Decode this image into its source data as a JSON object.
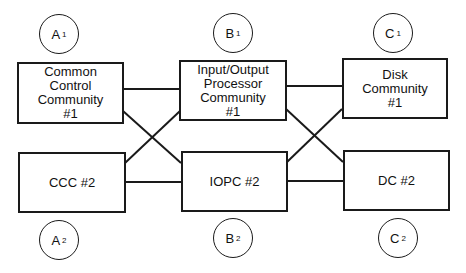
{
  "diagram": {
    "nodes": {
      "a1": {
        "lines": [
          "Common",
          "Control",
          "Community",
          "#1"
        ]
      },
      "a2": {
        "lines": [
          "CCC #2"
        ]
      },
      "b1": {
        "lines": [
          "Input/Output",
          "Processor",
          "Community",
          "#1"
        ]
      },
      "b2": {
        "lines": [
          "IOPC #2"
        ]
      },
      "c1": {
        "lines": [
          "Disk",
          "Community",
          "#1"
        ]
      },
      "c2": {
        "lines": [
          "DC #2"
        ]
      }
    },
    "labels": {
      "a1": {
        "letter": "A",
        "sub": "1"
      },
      "a2": {
        "letter": "A",
        "sub": "2"
      },
      "b1": {
        "letter": "B",
        "sub": "1"
      },
      "b2": {
        "letter": "B",
        "sub": "2"
      },
      "c1": {
        "letter": "C",
        "sub": "1"
      },
      "c2": {
        "letter": "C",
        "sub": "2"
      }
    },
    "connections": [
      {
        "from": "a1",
        "to": "b1"
      },
      {
        "from": "a1",
        "to": "b2"
      },
      {
        "from": "a2",
        "to": "b1"
      },
      {
        "from": "a2",
        "to": "b2"
      },
      {
        "from": "b1",
        "to": "c1"
      },
      {
        "from": "b1",
        "to": "c2"
      },
      {
        "from": "b2",
        "to": "c1"
      },
      {
        "from": "b2",
        "to": "c2"
      }
    ]
  }
}
